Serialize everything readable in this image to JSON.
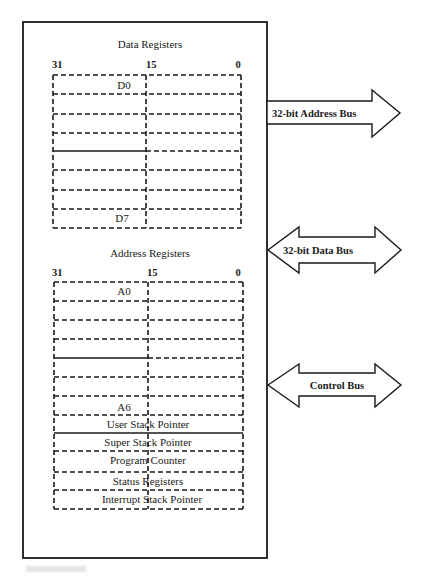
{
  "diagram": {
    "data_registers": {
      "title": "Data Registers",
      "bits": {
        "high": "31",
        "mid": "15",
        "low": "0"
      },
      "first_label": "D0",
      "last_label": "D7",
      "row_count": 8
    },
    "address_registers": {
      "title": "Address Registers",
      "bits": {
        "high": "31",
        "mid": "15",
        "low": "0"
      },
      "first_label": "A0",
      "last_label": "A6",
      "row_count": 7,
      "special_registers": [
        "User Stack Pointer",
        "Super Stack Pointer",
        "Program Counter",
        "Status Registers",
        "Interrupt Stack Pointer"
      ]
    },
    "buses": [
      {
        "label": "32-bit Address Bus",
        "direction": "out"
      },
      {
        "label": "32-bit Data Bus",
        "direction": "bidirectional"
      },
      {
        "label": "Control Bus",
        "direction": "bidirectional"
      }
    ]
  }
}
